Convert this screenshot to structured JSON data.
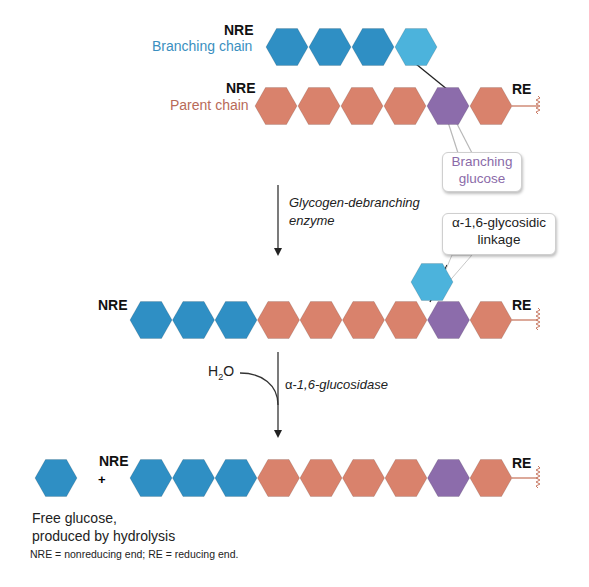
{
  "labels": {
    "nre": "NRE",
    "re": "RE",
    "branching_chain": "Branching chain",
    "parent_chain": "Parent chain",
    "branching_glucose_line1": "Branching",
    "branching_glucose_line2": "glucose",
    "enzyme1_line1": "Glycogen-debranching",
    "enzyme1_line2": "enzyme",
    "linkage_line1": "α-1,6-glycosidic",
    "linkage_line2": "linkage",
    "water_h": "H",
    "water_sub": "2",
    "water_o": "O",
    "enzyme2_alpha": "α-",
    "enzyme2_rest": "1,6-glucosidase",
    "plus": "+",
    "free_glucose_line1": "Free glucose,",
    "free_glucose_line2": "produced by hydrolysis",
    "footnote": "NRE = nonreducing end; RE = reducing end."
  },
  "colors": {
    "blue": "#2f8fc4",
    "light_blue": "#4cb3dc",
    "red": "#d9826c",
    "purple": "#8c6cab",
    "blue_text": "#3a8fc0",
    "red_text": "#b86a58",
    "purple_text": "#8a6aa8"
  },
  "rows": {
    "branching_chain": [
      "blue",
      "blue",
      "blue",
      "light_blue"
    ],
    "parent_chain": [
      "red",
      "red",
      "red",
      "red",
      "purple",
      "red"
    ],
    "after_transfer": [
      "blue",
      "blue",
      "blue",
      "red",
      "red",
      "red",
      "red",
      "purple",
      "red"
    ],
    "after_hydrolysis": [
      "blue",
      "blue",
      "blue",
      "red",
      "red",
      "red",
      "red",
      "purple",
      "red"
    ]
  }
}
